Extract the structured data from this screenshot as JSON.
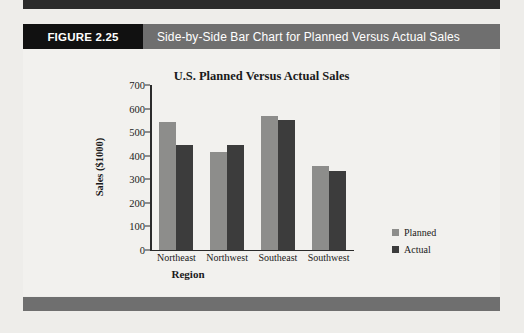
{
  "figure": {
    "badge": "FIGURE 2.25",
    "caption": "Side-by-Side Bar Chart for Planned Versus Actual Sales"
  },
  "colors": {
    "badge_bg": "#111111",
    "caption_bg": "#6f6f6f",
    "planned": "#8d8d8b",
    "actual": "#3c3c3c",
    "page_bg": "#eeedea",
    "panel_bg": "#f2f1ee"
  },
  "chart_data": {
    "type": "bar",
    "title": "U.S. Planned Versus Actual Sales",
    "xlabel": "Region",
    "ylabel": "Sales ($1000)",
    "categories": [
      "Northeast",
      "Northwest",
      "Southeast",
      "Southwest"
    ],
    "series": [
      {
        "name": "Planned",
        "values": [
          545,
          415,
          567,
          355
        ],
        "color": "#8d8d8b"
      },
      {
        "name": "Actual",
        "values": [
          446,
          446,
          550,
          337
        ],
        "color": "#3c3c3c"
      }
    ],
    "ylim": [
      0,
      700
    ],
    "ytick_step": 100,
    "yticks": [
      700,
      600,
      500,
      400,
      300,
      200,
      100,
      0
    ],
    "grid": false,
    "legend_position": "right"
  }
}
